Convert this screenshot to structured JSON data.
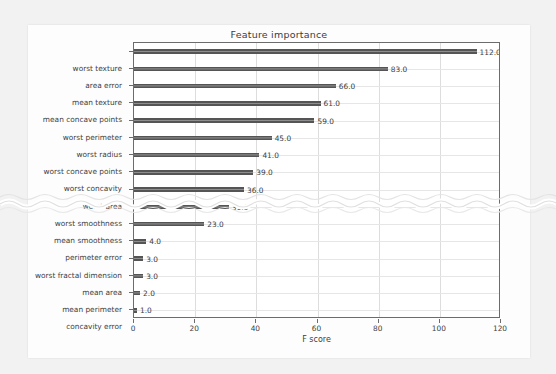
{
  "chart_data": {
    "type": "bar",
    "orientation": "horizontal",
    "title": "Feature importance",
    "xlabel": "F score",
    "ylabel": "",
    "xlim": [
      0,
      120
    ],
    "xticks": [
      0,
      20,
      40,
      60,
      80,
      100,
      120
    ],
    "grid": true,
    "legend": null,
    "bar_color": "#555555",
    "categories": [
      "worst texture",
      "area error",
      "mean texture",
      "mean concave points",
      "worst perimeter",
      "worst radius",
      "worst concave points",
      "worst concavity",
      "worst area",
      "worst smoothness",
      "mean smoothness",
      "perimeter error",
      "worst fractal dimension",
      "mean area",
      "mean perimeter",
      "concavity error"
    ],
    "values": [
      112,
      83,
      66,
      61,
      59,
      45,
      41,
      39,
      36,
      31,
      23,
      4,
      3,
      3,
      2,
      1
    ],
    "value_labels": [
      "112.0",
      "83.0",
      "66.0",
      "61.0",
      "59.0",
      "45.0",
      "41.0",
      "39.0",
      "36.0",
      "31.0",
      "23.0",
      "4.0",
      "3.0",
      "3.0",
      "2.0",
      "1.0"
    ]
  },
  "figure": {
    "title": "Feature importance",
    "xaxis_label": "F score",
    "xtick_labels": [
      "0",
      "20",
      "40",
      "60",
      "80",
      "100",
      "120"
    ]
  }
}
